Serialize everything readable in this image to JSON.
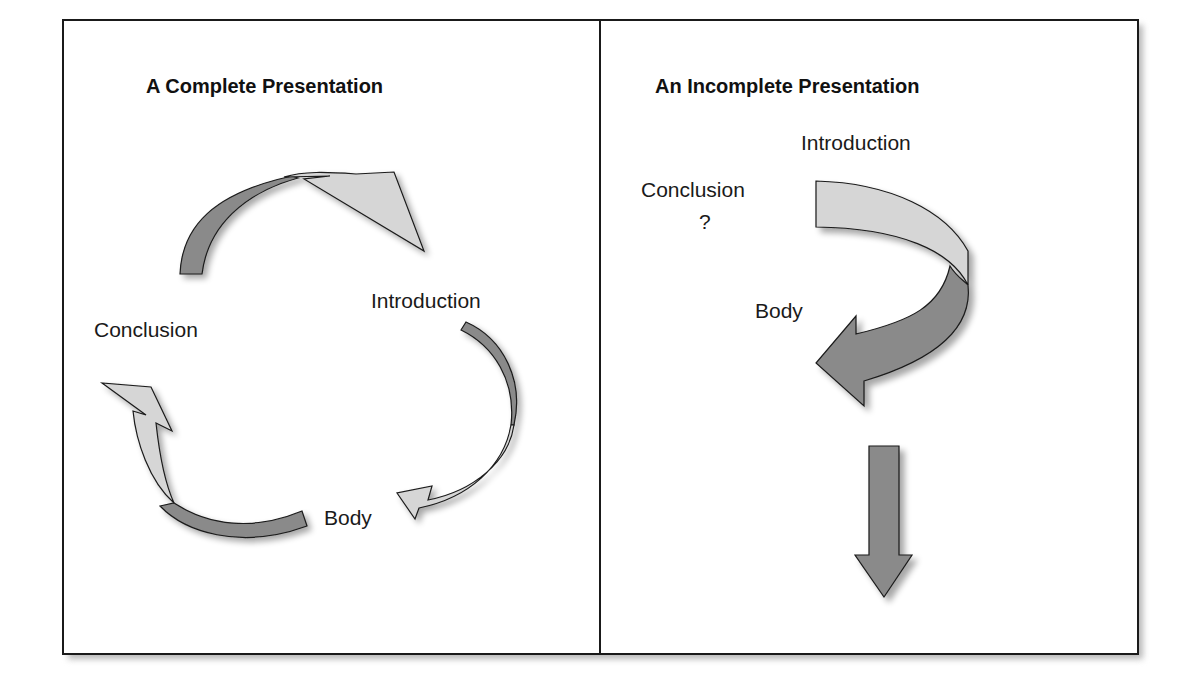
{
  "figure": {
    "panels": [
      {
        "title": "A Complete Presentation",
        "labels": {
          "introduction": "Introduction",
          "body": "Body",
          "conclusion": "Conclusion"
        },
        "arrows": [
          {
            "from": "Conclusion",
            "to": "Introduction",
            "shape": "curved-arrow"
          },
          {
            "from": "Introduction",
            "to": "Body",
            "shape": "curved-arrow"
          },
          {
            "from": "Body",
            "to": "Conclusion",
            "shape": "curved-arrow"
          }
        ]
      },
      {
        "title": "An Incomplete Presentation",
        "labels": {
          "introduction": "Introduction",
          "body": "Body",
          "conclusion": "Conclusion",
          "conclusion_mark": "?"
        },
        "arrows": [
          {
            "from": "Introduction",
            "to": "Body",
            "shape": "u-turn-arrow"
          },
          {
            "from": "Body",
            "to": "nowhere",
            "shape": "straight-down-arrow"
          }
        ]
      }
    ],
    "colors": {
      "light_fill": "#d6d6d6",
      "dark_fill": "#8a8a8a",
      "stroke": "#1a1a1a",
      "border": "#1a1a1a"
    }
  }
}
